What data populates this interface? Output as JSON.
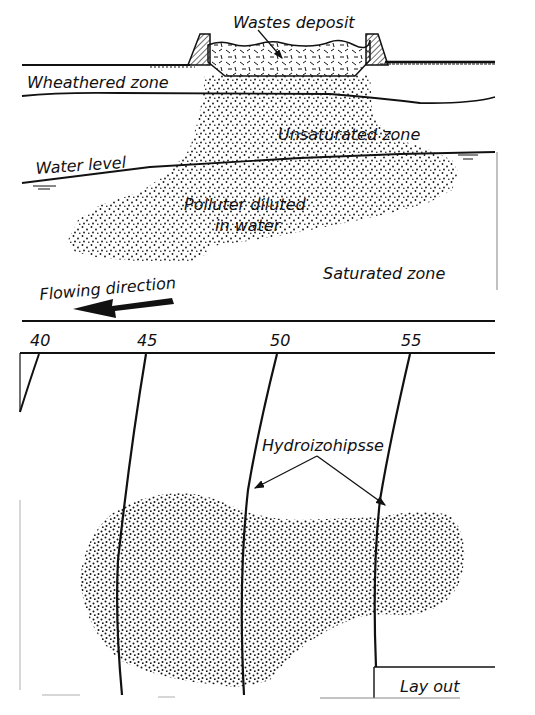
{
  "colors": {
    "ink": "#111111",
    "background": "#ffffff",
    "hatch": "#222222"
  },
  "section": {
    "labels": {
      "wastes_deposit": "Wastes deposit",
      "weathered_zone": "Wheathered zone",
      "unsaturated_zone": "Unsaturated zone",
      "water_level": "Water level",
      "polluter_line1": "Polluter diluted",
      "polluter_line2": "in water",
      "saturated_zone": "Saturated zone",
      "flowing_direction": "Flowing direction"
    }
  },
  "plan": {
    "contours": [
      {
        "label": "40"
      },
      {
        "label": "45"
      },
      {
        "label": "50"
      },
      {
        "label": "55"
      }
    ],
    "hydro_label": "Hydroizohipsse",
    "layout_label": "Lay out"
  }
}
